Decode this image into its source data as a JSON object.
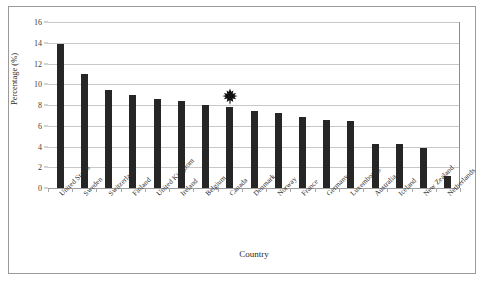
{
  "chart_data": {
    "type": "bar",
    "title": "",
    "xlabel": "Country",
    "ylabel": "Percentage (%)",
    "categories": [
      "United States",
      "Sweden",
      "Switzerland",
      "Finland",
      "United Kingdom",
      "Ireland",
      "Belgium",
      "Canada",
      "Denmark",
      "Norway",
      "France",
      "Germany",
      "Luxembourg",
      "Australia",
      "Iceland",
      "New Zealand",
      "Netherlands"
    ],
    "values": [
      13.9,
      11.0,
      9.4,
      9.0,
      8.6,
      8.4,
      8.0,
      7.8,
      7.4,
      7.2,
      6.8,
      6.6,
      6.5,
      4.2,
      4.2,
      3.9,
      1.2
    ],
    "ylim": [
      0,
      16
    ],
    "ytick_values": [
      0,
      2,
      4,
      6,
      8,
      10,
      12,
      14,
      16
    ],
    "ytick_labels": [
      "0",
      "2",
      "4",
      "6",
      "8",
      "10",
      "12",
      "14",
      "16"
    ],
    "grid": true,
    "legend": false,
    "bar_color": "#262626",
    "gridline_color": "#c8c8c8",
    "axis_color": "#8c8c8c",
    "annotations": [
      {
        "kind": "maple-leaf-marker",
        "category": "Canada",
        "label": "",
        "color": "#111111"
      }
    ]
  }
}
